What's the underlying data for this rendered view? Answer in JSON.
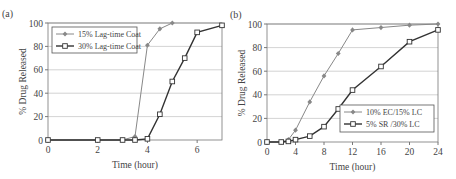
{
  "chart_data": [
    {
      "type": "line",
      "panel_label": "(a)",
      "title": "",
      "xlabel": "Time (hour)",
      "ylabel": "% Drug Released",
      "xlim": [
        0,
        7
      ],
      "ylim": [
        0,
        100
      ],
      "xticks": [
        0,
        2,
        4,
        6
      ],
      "yticks": [
        0,
        20,
        40,
        60,
        80,
        100
      ],
      "grid": "horizontal",
      "legend_position": "upper-left",
      "series": [
        {
          "name": "15% Lag-time Coat",
          "marker": "diamond-filled",
          "color": "#888888",
          "x": [
            0,
            2,
            3,
            3.5,
            4,
            4.5,
            5
          ],
          "y": [
            0,
            0,
            0,
            3,
            81,
            95,
            100
          ]
        },
        {
          "name": "30% Lag-time Coat",
          "marker": "square-open",
          "color": "#333333",
          "x": [
            0,
            2,
            3,
            3.5,
            4,
            4.5,
            5,
            5.5,
            6,
            7
          ],
          "y": [
            0,
            0,
            0,
            0,
            1,
            22,
            50,
            70,
            92,
            98
          ]
        }
      ]
    },
    {
      "type": "line",
      "panel_label": "(b)",
      "title": "",
      "xlabel": "Time (hour)",
      "ylabel": "% Drug Released",
      "xlim": [
        0,
        24
      ],
      "ylim": [
        0,
        100
      ],
      "xticks": [
        0,
        4,
        8,
        12,
        16,
        20,
        24
      ],
      "yticks": [
        0,
        20,
        40,
        60,
        80,
        100
      ],
      "grid": "horizontal",
      "legend_position": "lower-right",
      "series": [
        {
          "name": "10% EC/15% LC",
          "marker": "diamond-filled",
          "color": "#888888",
          "x": [
            0,
            2,
            3,
            4,
            6,
            8,
            10,
            12,
            16,
            20,
            24
          ],
          "y": [
            0,
            0,
            2,
            10,
            34,
            56,
            75,
            95,
            97,
            99,
            100
          ]
        },
        {
          "name": "5% SR /30% LC",
          "marker": "square-open",
          "color": "#333333",
          "x": [
            0,
            2,
            3,
            4,
            6,
            8,
            10,
            12,
            16,
            20,
            24
          ],
          "y": [
            0,
            0,
            0.5,
            2,
            5,
            13,
            28,
            44,
            64,
            85,
            95
          ]
        }
      ]
    }
  ]
}
